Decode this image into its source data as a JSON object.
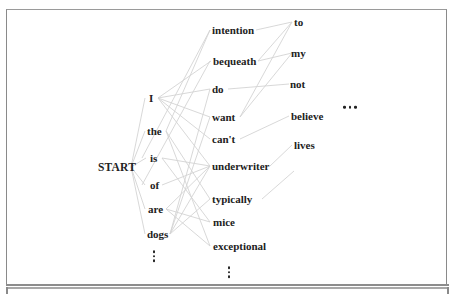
{
  "diagram": {
    "type": "word-lattice",
    "edge_color": "#d4d4d4",
    "start": {
      "label": "START",
      "x": 98,
      "y": 167
    },
    "columns": [
      {
        "name": "col1",
        "words": [
          {
            "label": "I",
            "x": 149,
            "y": 98
          },
          {
            "label": "the",
            "x": 147,
            "y": 131
          },
          {
            "label": "is",
            "x": 150,
            "y": 158
          },
          {
            "label": "of",
            "x": 150,
            "y": 185
          },
          {
            "label": "are",
            "x": 148,
            "y": 209
          },
          {
            "label": "dogs",
            "x": 147,
            "y": 234
          }
        ],
        "more_indicator": {
          "type": "vertical-ellipsis",
          "x": 154,
          "y": 256
        }
      },
      {
        "name": "col2",
        "words": [
          {
            "label": "intention",
            "x": 212,
            "y": 30
          },
          {
            "label": "bequeath",
            "x": 213,
            "y": 61
          },
          {
            "label": "do",
            "x": 212,
            "y": 89
          },
          {
            "label": "want",
            "x": 212,
            "y": 117
          },
          {
            "label": "can't",
            "x": 212,
            "y": 139
          },
          {
            "label": "underwriter",
            "x": 212,
            "y": 166
          },
          {
            "label": "typically",
            "x": 212,
            "y": 199
          },
          {
            "label": "mice",
            "x": 213,
            "y": 222
          },
          {
            "label": "exceptional",
            "x": 213,
            "y": 246
          }
        ],
        "more_indicator": {
          "type": "vertical-ellipsis",
          "x": 229,
          "y": 272
        }
      },
      {
        "name": "col3",
        "words": [
          {
            "label": "to",
            "x": 294,
            "y": 22
          },
          {
            "label": "my",
            "x": 291,
            "y": 53
          },
          {
            "label": "not",
            "x": 290,
            "y": 84
          },
          {
            "label": "believe",
            "x": 291,
            "y": 116
          },
          {
            "label": "lives",
            "x": 294,
            "y": 145
          }
        ]
      }
    ],
    "more_columns_indicator": {
      "type": "horizontal-ellipsis",
      "x": 343,
      "y": 107
    },
    "edges": [
      {
        "from": [
          131,
          167
        ],
        "to": [
          146,
          158
        ]
      },
      {
        "from": [
          131,
          167
        ],
        "to": [
          145,
          98
        ]
      },
      {
        "from": [
          131,
          167
        ],
        "to": [
          145,
          131
        ]
      },
      {
        "from": [
          131,
          167
        ],
        "to": [
          145,
          185
        ]
      },
      {
        "from": [
          131,
          167
        ],
        "to": [
          145,
          209
        ]
      },
      {
        "from": [
          131,
          167
        ],
        "to": [
          145,
          234
        ]
      },
      {
        "from": [
          158,
          98
        ],
        "to": [
          210,
          89
        ]
      },
      {
        "from": [
          158,
          98
        ],
        "to": [
          210,
          117
        ]
      },
      {
        "from": [
          158,
          98
        ],
        "to": [
          211,
          61
        ]
      },
      {
        "from": [
          158,
          98
        ],
        "to": [
          210,
          139
        ]
      },
      {
        "from": [
          158,
          98
        ],
        "to": [
          210,
          166
        ]
      },
      {
        "from": [
          142,
          158
        ],
        "to": [
          210,
          30
        ]
      },
      {
        "from": [
          142,
          185
        ],
        "to": [
          210,
          61
        ]
      },
      {
        "from": [
          162,
          158
        ],
        "to": [
          210,
          166
        ]
      },
      {
        "from": [
          162,
          158
        ],
        "to": [
          210,
          222
        ]
      },
      {
        "from": [
          166,
          131
        ],
        "to": [
          210,
          199
        ]
      },
      {
        "from": [
          166,
          131
        ],
        "to": [
          210,
          246
        ]
      },
      {
        "from": [
          162,
          185
        ],
        "to": [
          210,
          166
        ]
      },
      {
        "from": [
          166,
          209
        ],
        "to": [
          210,
          166
        ]
      },
      {
        "from": [
          166,
          209
        ],
        "to": [
          210,
          222
        ]
      },
      {
        "from": [
          166,
          209
        ],
        "to": [
          210,
          246
        ]
      },
      {
        "from": [
          170,
          234
        ],
        "to": [
          210,
          166
        ]
      },
      {
        "from": [
          170,
          234
        ],
        "to": [
          210,
          199
        ]
      },
      {
        "from": [
          170,
          234
        ],
        "to": [
          210,
          89
        ]
      },
      {
        "from": [
          170,
          234
        ],
        "to": [
          210,
          117
        ]
      },
      {
        "from": [
          166,
          131
        ],
        "to": [
          210,
          30
        ]
      },
      {
        "from": [
          256,
          30
        ],
        "to": [
          292,
          22
        ]
      },
      {
        "from": [
          258,
          61
        ],
        "to": [
          292,
          53
        ]
      },
      {
        "from": [
          258,
          61
        ],
        "to": [
          292,
          22
        ]
      },
      {
        "from": [
          228,
          89
        ],
        "to": [
          289,
          84
        ]
      },
      {
        "from": [
          240,
          117
        ],
        "to": [
          292,
          22
        ]
      },
      {
        "from": [
          240,
          117
        ],
        "to": [
          292,
          53
        ]
      },
      {
        "from": [
          240,
          139
        ],
        "to": [
          289,
          116
        ]
      },
      {
        "from": [
          270,
          166
        ],
        "to": [
          292,
          145
        ]
      },
      {
        "from": [
          262,
          199
        ],
        "to": [
          294,
          171
        ]
      }
    ]
  }
}
